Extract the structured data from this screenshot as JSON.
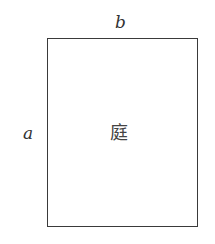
{
  "diagram": {
    "shape": "rectangle",
    "top_label": "b",
    "side_label": "a",
    "center_label": "庭",
    "stroke_color": "#3a3a3a",
    "text_color": "#333333"
  }
}
